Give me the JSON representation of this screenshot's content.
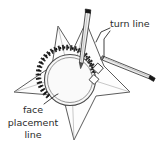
{
  "figure": {
    "type": "line-diagram",
    "background_color": "#ffffff",
    "ink_color": "#3a3a3a",
    "fill_color": "#fdfdfd",
    "accent_dark": "#1a1a1a"
  },
  "labels": {
    "turn_line": "turn line",
    "face_placement": {
      "line1": "face",
      "line2": "placement",
      "line3": "line"
    }
  },
  "shapes": {
    "star_name": "five-point-star",
    "circle_name": "face-placement-circle",
    "teeth_name": "stitch-teeth-arc",
    "tool_vertical_name": "marking-tool-vertical",
    "tool_angled_name": "marking-tool-angled",
    "marker_squares": 2
  }
}
